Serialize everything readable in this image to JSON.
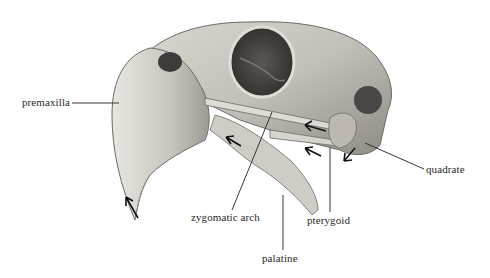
{
  "figure": {
    "labels": {
      "premaxilla": "premaxilla",
      "zygomatic_arch": "zygomatic arch",
      "palatine": "palatine",
      "pterygoid": "pterygoid",
      "quadrate": "quadrate"
    }
  },
  "colors": {
    "background": "#ffffff",
    "bone_light": "#e6e3dc",
    "bone_mid": "#b9b5ad",
    "bone_dark": "#6d6a65",
    "cavity": "#3a3836",
    "line": "#222222",
    "text": "#2a2a2a"
  }
}
